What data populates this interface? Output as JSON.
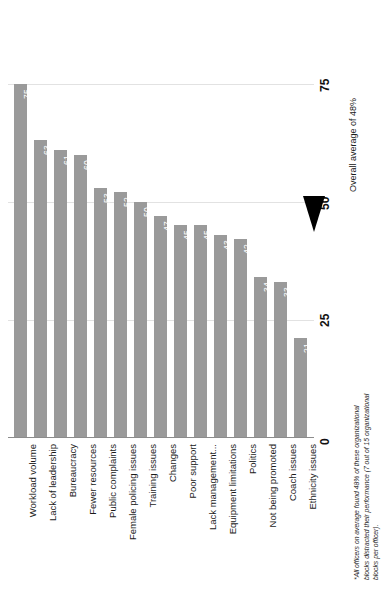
{
  "chart_data": {
    "type": "bar",
    "orientation": "vertical-rotated-90",
    "title": "",
    "subtitle": "",
    "xlabel": "",
    "ylabel": "",
    "ylim": [
      0,
      80
    ],
    "grid": true,
    "tick_labels": [
      "0",
      "25",
      "50",
      "75"
    ],
    "tick_values": [
      0,
      25,
      50,
      75
    ],
    "categories": [
      "Workload volume",
      "Lack of leadership",
      "Bureaucracy",
      "Fewer resources",
      "Public complaints",
      "Female policing issues",
      "Training issues",
      "Changes",
      "Poor support",
      "Lack management...",
      "Equipment limitations",
      "Politics",
      "Not being promoted",
      "Coach issues",
      "Ethnicity issues"
    ],
    "values": [
      75,
      63,
      61,
      60,
      53,
      52,
      50,
      47,
      45,
      45,
      43,
      42,
      34,
      33,
      21
    ],
    "value_labels": [
      "75",
      "63",
      "61",
      "60",
      "53",
      "52",
      "50",
      "47",
      "45",
      "45",
      "43",
      "42",
      "34",
      "33",
      "21"
    ],
    "annotations": {
      "average_label": "Overall average of 48%",
      "average_value": 48,
      "average_marker": "triangle-pointer"
    },
    "footnote": "*All officers on average found 48% of these organizational blocks distracted their performance (7 out of 15 organizational blocks per officer).",
    "colors": {
      "bar": "#9a9a9a",
      "value_label": "#ffffff",
      "gridline": "#e2e2e2",
      "baseline": "#8c8c8c",
      "axis_text": "#111111",
      "pointer": "#000000",
      "background": "#ffffff"
    }
  }
}
